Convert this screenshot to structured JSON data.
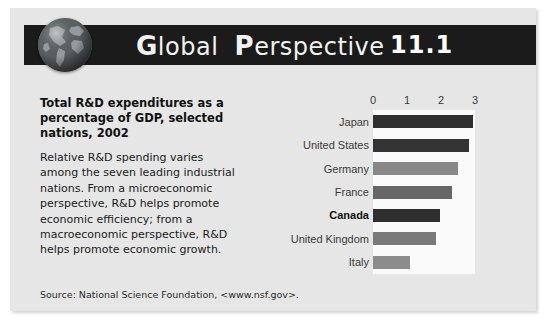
{
  "header": {
    "icon": "globe-icon",
    "title_plain": "lobal",
    "title_cap1": "G",
    "title_cap2": "P",
    "title_rest": "erspective",
    "title_full": "Global Perspective",
    "number": "11.1",
    "banner_color": "#1b1b1b"
  },
  "content": {
    "headline": "Total R&D expenditures as a percentage of GDP, selected nations, 2002",
    "body": "Relative R&D spending varies among the seven leading industrial nations. From a microeconomic perspective, R&D helps promote economic efficiency; from a macroeconomic perspective, R&D helps promote economic growth.",
    "source": "Source: National Science Foundation, <www.nsf.gov>."
  },
  "chart_data": {
    "type": "bar",
    "orientation": "horizontal",
    "title": "Total R&D expenditures as a percentage of GDP, selected nations, 2002",
    "xlabel": "",
    "ylabel": "",
    "xlim": [
      0,
      3
    ],
    "ticks": [
      0,
      1,
      2,
      3
    ],
    "tick_labels": [
      "0",
      "1",
      "2",
      "3"
    ],
    "grid": false,
    "legend": "none",
    "categories": [
      "Japan",
      "United States",
      "Germany",
      "France",
      "Canada",
      "United Kingdom",
      "Italy"
    ],
    "values": [
      2.93,
      2.81,
      2.5,
      2.32,
      1.97,
      1.86,
      1.08
    ],
    "highlight": "Canada",
    "bar_colors": [
      "#2f2f2f",
      "#333333",
      "#888888",
      "#666666",
      "#2f2f2f",
      "#7a7a7a",
      "#8c8c8c"
    ],
    "plot_background": "#fafafa"
  },
  "colors": {
    "card_background": "#e6e6e6",
    "page_background": "#ffffff",
    "text": "#1a1a1a"
  }
}
